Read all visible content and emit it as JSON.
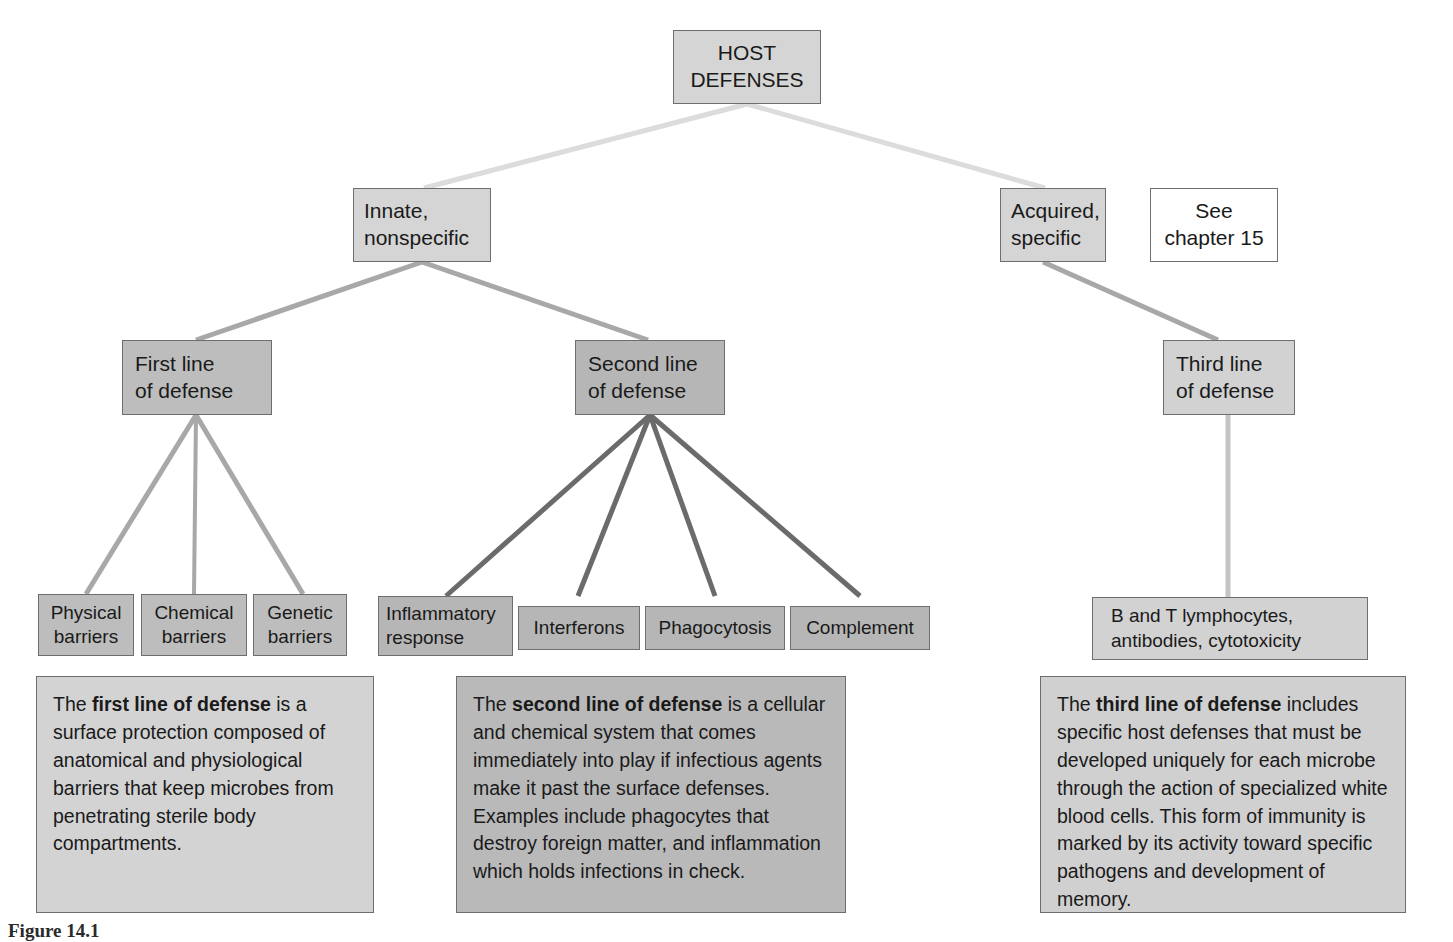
{
  "diagram": {
    "colors": {
      "box_light": "#d5d5d5",
      "box_mid": "#bdbdbd",
      "box_white": "#ffffff",
      "border": "#6e6e6e",
      "edge_light": "#dcdcdc",
      "edge_mid": "#a8a8a8",
      "edge_dark": "#6b6b6b",
      "text": "#1a1a1a"
    },
    "nodes": {
      "host_defenses": {
        "line1": "HOST",
        "line2": "DEFENSES"
      },
      "innate": {
        "line1": "Innate,",
        "line2": "nonspecific"
      },
      "acquired": {
        "line1": "Acquired,",
        "line2": "specific"
      },
      "see_chapter": {
        "line1": "See",
        "line2": "chapter 15"
      },
      "first_line": {
        "line1": "First line",
        "line2": "of defense"
      },
      "second_line": {
        "line1": "Second line",
        "line2": "of defense"
      },
      "third_line": {
        "line1": "Third line",
        "line2": "of defense"
      },
      "physical_barriers": {
        "line1": "Physical",
        "line2": "barriers"
      },
      "chemical_barriers": {
        "line1": "Chemical",
        "line2": "barriers"
      },
      "genetic_barriers": {
        "line1": "Genetic",
        "line2": "barriers"
      },
      "inflammatory_response": {
        "line1": "Inflammatory",
        "line2": "response"
      },
      "interferons": {
        "line1": "Interferons",
        "line2": ""
      },
      "phagocytosis": {
        "line1": "Phagocytosis",
        "line2": ""
      },
      "complement": {
        "line1": "Complement",
        "line2": ""
      },
      "lymphocytes": {
        "line1": "B and T lymphocytes,",
        "line2": "antibodies, cytotoxicity"
      }
    },
    "panels": {
      "first": {
        "prefix": "The ",
        "bold": "first line of defense",
        "rest": " is a surface protection composed of anatomical and physiological barriers that keep microbes from penetrating sterile body compartments."
      },
      "second": {
        "prefix": "The ",
        "bold": "second line of defense",
        "rest": " is a cellular and chemical system that comes immediately into play if infectious agents make it past the surface defenses. Examples include phagocytes that destroy foreign matter, and inflammation which holds infections in check."
      },
      "third": {
        "prefix": "The ",
        "bold": "third line of defense",
        "rest": " includes specific host defenses that must be developed uniquely for each microbe through the action of specialized white blood cells. This form of immunity is marked by its activity toward specific pathogens and development of memory."
      }
    },
    "caption": "Figure 14.1"
  }
}
